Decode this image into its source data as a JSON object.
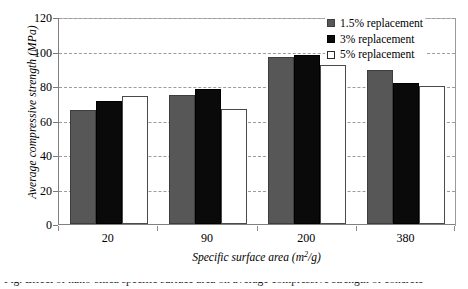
{
  "chart_data": {
    "type": "bar",
    "title": "",
    "xlabel_text": "Specific surface area (m",
    "xlabel_sup": "2",
    "xlabel_tail": "/g)",
    "xlabel": "Specific surface area (m2/g)",
    "ylabel": "Average compressive strength (MPa)",
    "categories": [
      "20",
      "90",
      "200",
      "380"
    ],
    "series": [
      {
        "name": "1.5% replacement",
        "color": "#575757",
        "values": [
          66,
          75,
          97,
          89
        ]
      },
      {
        "name": "3% replacement",
        "color": "#0a0a0a",
        "values": [
          71.5,
          78.5,
          98,
          82
        ]
      },
      {
        "name": "5% replacement",
        "color": "#ffffff",
        "values": [
          74.5,
          66.5,
          92,
          80
        ]
      }
    ],
    "ylim": [
      0,
      120
    ],
    "ytick_values": [
      "120",
      "100",
      "80",
      "60",
      "40",
      "20",
      "0"
    ],
    "grid": true,
    "legend_position": "upper-right"
  },
  "legend": {
    "items": [
      {
        "label": "1.5% replacement"
      },
      {
        "label": "3% replacement"
      },
      {
        "label": "5% replacement"
      }
    ]
  },
  "caption": {
    "sliver_text": "Fig. Effect of nano-silica specific surface area on average compressive strength of concrete"
  }
}
